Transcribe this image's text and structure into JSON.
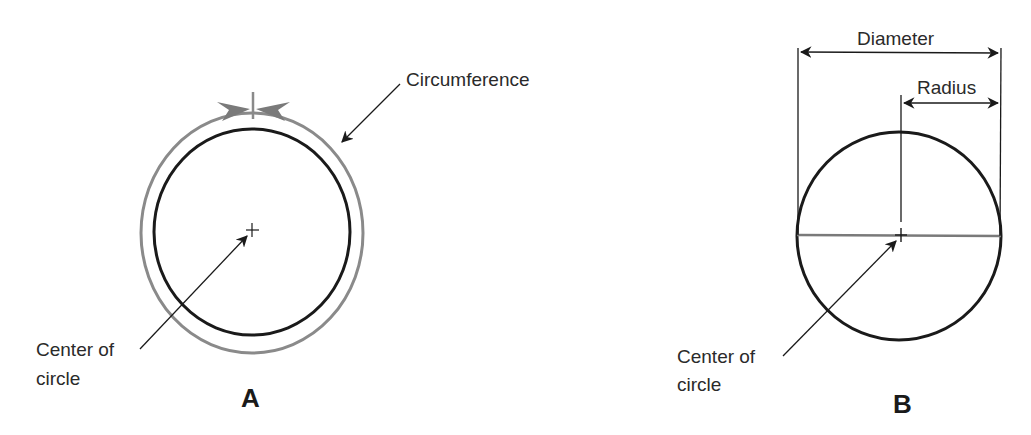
{
  "figure": {
    "panel_a": {
      "letter": "A",
      "labels": {
        "circumference": "Circumference",
        "center_line1": "Center of",
        "center_line2": "circle"
      }
    },
    "panel_b": {
      "letter": "B",
      "labels": {
        "diameter": "Diameter",
        "radius": "Radius",
        "center_line1": "Center of",
        "center_line2": "circle"
      }
    },
    "colors": {
      "outline": "#1a1a1a",
      "circumference_ring": "#8a8a8a",
      "diameter_line": "#7a7a7a",
      "background": "#ffffff"
    }
  }
}
